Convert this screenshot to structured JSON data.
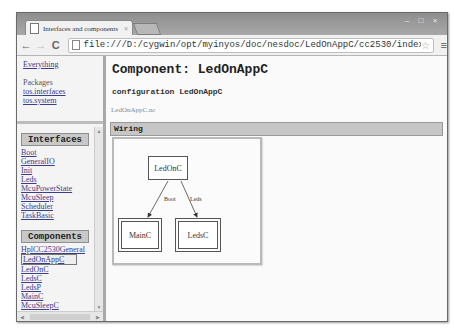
{
  "window": {
    "tab_title": "Interfaces and components",
    "tab_close": "×",
    "controls": [
      "–",
      "□",
      "×"
    ]
  },
  "toolbar": {
    "back": "←",
    "forward": "→",
    "reload": "C",
    "url": "file:///D:/cygwin/opt/myinyos/doc/nesdoc/LedOnAppC/cc2530/index.html",
    "star": "☆",
    "menu": "≡"
  },
  "sidebar": {
    "everything": "Everything",
    "packages_label": "Packages",
    "packages": [
      "tos.interfaces",
      "tos.system"
    ],
    "interfaces_heading": "Interfaces",
    "interfaces": [
      "Boot",
      "GeneralIO",
      "Init",
      "Leds",
      "McuPowerState",
      "McuSleep",
      "Scheduler",
      "TaskBasic"
    ],
    "components_heading": "Components",
    "components": [
      "HplCC2530General",
      "LedOnAppC",
      "LedOnC",
      "LedsC",
      "LedsP",
      "MainC",
      "McuSleepC"
    ],
    "selected_component": "LedOnAppC",
    "scroll_up": "▲",
    "scroll_down": "▼",
    "scroll_left": "◀",
    "scroll_right": "▶"
  },
  "main": {
    "title": "Component: LedOnAppC",
    "configuration": "configuration LedOnAppC",
    "filename": "LedOnAppC.nc",
    "wiring_heading": "Wiring",
    "diagram": {
      "nodes": {
        "top": "LedOnC",
        "left": "MainC",
        "right": "LedsC"
      },
      "edges": {
        "left": "Boot",
        "right": "Leds"
      }
    }
  }
}
